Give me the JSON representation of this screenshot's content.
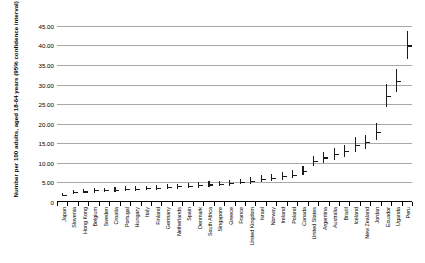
{
  "chart_data": {
    "type": "scatter",
    "title": "",
    "xlabel": "",
    "ylabel": "Number per 100 adults, aged 18-64 years (95% confidence interval)",
    "ylim": [
      0,
      47
    ],
    "ytick_labels": [
      "45.00",
      "40.00",
      "35.00",
      "30.00",
      "25.00",
      "20.00",
      "15.00",
      "10.00",
      "5.00",
      "0"
    ],
    "ytick_values": [
      45,
      40,
      35,
      30,
      25,
      20,
      15,
      10,
      5,
      0
    ],
    "grid": true,
    "legend": "none",
    "error_bars": "95% confidence interval",
    "categories": [
      "Japan",
      "Slovenia",
      "Hong Kong",
      "Belgium",
      "Sweden",
      "Croatia",
      "Portugal",
      "Hungary",
      "Italy",
      "Finland",
      "Germany",
      "Netherlands",
      "Spain",
      "Denmark",
      "South Africa",
      "Singapore",
      "Greece",
      "France",
      "United Kingdom",
      "Israel",
      "Norway",
      "Ireland",
      "Poland",
      "Canada",
      "United States",
      "Argentina",
      "Australia",
      "Brazil",
      "Iceland",
      "New Zealand",
      "Jordan",
      "Ecuador",
      "Uganda",
      "Peru"
    ],
    "values": [
      1.9,
      2.6,
      2.7,
      3.0,
      3.1,
      3.2,
      3.3,
      3.4,
      3.5,
      3.6,
      3.8,
      4.0,
      4.2,
      4.4,
      4.5,
      4.7,
      4.9,
      5.2,
      5.5,
      5.9,
      6.2,
      6.6,
      7.0,
      8.0,
      10.4,
      11.4,
      12.2,
      13.0,
      14.7,
      15.3,
      18.0,
      27.2,
      31.0,
      40.0
    ],
    "ci_low": [
      1.4,
      2.0,
      2.2,
      2.4,
      2.5,
      2.6,
      2.7,
      2.9,
      3.0,
      3.1,
      3.2,
      3.4,
      3.6,
      3.7,
      3.8,
      4.0,
      4.2,
      4.5,
      4.7,
      5.0,
      5.3,
      5.6,
      6.0,
      6.8,
      9.2,
      10.0,
      10.8,
      11.4,
      12.9,
      13.5,
      15.9,
      24.3,
      28.0,
      36.5
    ],
    "ci_high": [
      2.4,
      3.2,
      3.3,
      3.6,
      3.7,
      3.8,
      4.0,
      4.1,
      4.2,
      4.3,
      4.5,
      4.7,
      4.9,
      5.1,
      5.3,
      5.5,
      5.7,
      6.0,
      6.4,
      6.8,
      7.2,
      7.7,
      8.1,
      9.3,
      11.7,
      12.9,
      13.7,
      14.7,
      16.6,
      17.2,
      20.2,
      30.2,
      34.1,
      43.6
    ]
  },
  "axis": {
    "y_title": "Number per 100 adults, aged 18-64 years (95% confidence interval)"
  },
  "colors": {
    "grid": "#a9a9a9",
    "marker": "#1a1a1a",
    "axis": "#000000",
    "background": "#ffffff"
  }
}
